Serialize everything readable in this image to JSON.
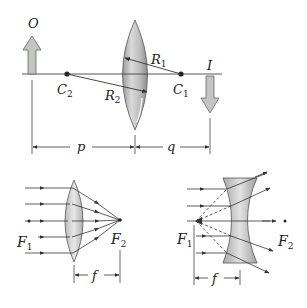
{
  "top_figure": {
    "object_label": "O",
    "image_label": "I",
    "center2_label": "C",
    "center2_sub": "2",
    "center1_label": "C",
    "center1_sub": "1",
    "radius1_label": "R",
    "radius1_sub": "1",
    "radius2_label": "R",
    "radius2_sub": "2",
    "object_distance_label": "p",
    "image_distance_label": "q"
  },
  "converging_lens": {
    "focal1_label": "F",
    "focal1_sub": "1",
    "focal2_label": "F",
    "focal2_sub": "2",
    "focal_length_label": "f"
  },
  "diverging_lens": {
    "focal1_label": "F",
    "focal1_sub": "1",
    "focal2_label": "F",
    "focal2_sub": "2",
    "focal_length_label": "f"
  },
  "colors": {
    "line": "#333333",
    "lens_fill": "#c8c8c8",
    "arrow_fill": "#c4c4c4",
    "object_arrow_outline": "#4a7a4a"
  }
}
